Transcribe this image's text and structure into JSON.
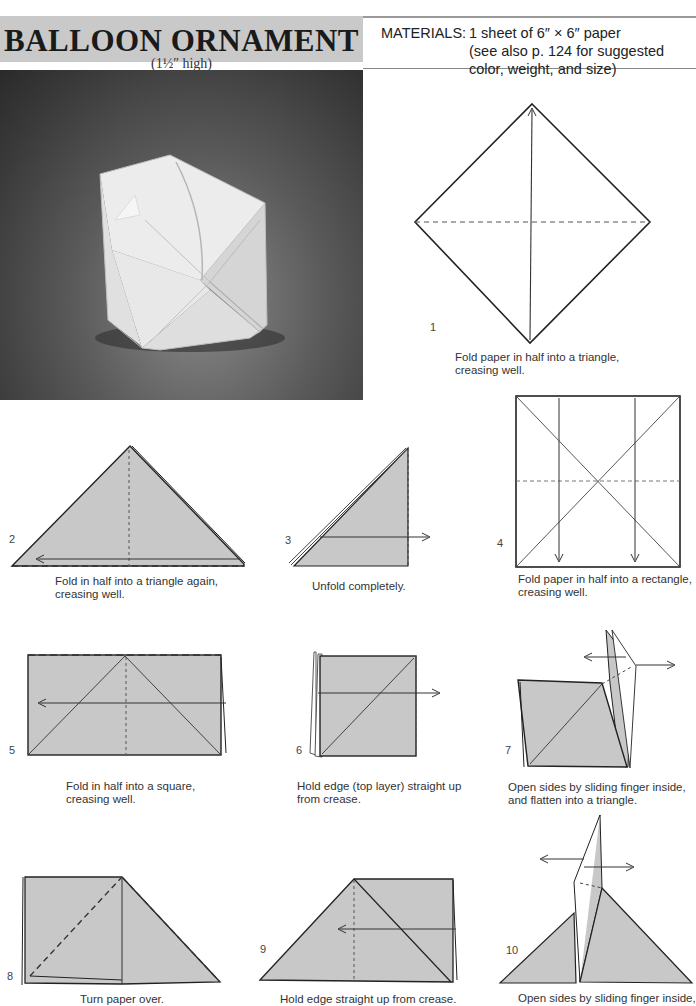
{
  "header": {
    "title": "BALLOON ORNAMENT",
    "subtitle": "(1½″ high)",
    "materials_label": "MATERIALS:",
    "materials_line1": "1 sheet of 6″ × 6″ paper",
    "materials_line2": "(see also p. 124 for suggested color, weight, and size)"
  },
  "photo": {
    "subject": "white folded paper balloon cube on dark gray background"
  },
  "colors": {
    "paper_fill": "#c8c8c8",
    "title_bg": "#c9c9c9",
    "line": "#222222"
  },
  "steps": [
    {
      "number": "1",
      "caption_line1": "Fold paper in half into a triangle,",
      "caption_line2": "creasing well."
    },
    {
      "number": "2",
      "caption_line1": "Fold in half into a triangle again,",
      "caption_line2": "creasing well."
    },
    {
      "number": "3",
      "caption_line1": "Unfold completely.",
      "caption_line2": ""
    },
    {
      "number": "4",
      "caption_line1": "Fold paper in half into a rectangle,",
      "caption_line2": "creasing well."
    },
    {
      "number": "5",
      "caption_line1": "Fold in half into a square,",
      "caption_line2": "creasing well."
    },
    {
      "number": "6",
      "caption_line1": "Hold edge (top layer) straight up",
      "caption_line2": "from crease."
    },
    {
      "number": "7",
      "caption_line1": "Open sides by sliding finger inside,",
      "caption_line2": "and flatten into a triangle."
    },
    {
      "number": "8",
      "caption_line1": "Turn paper over.",
      "caption_line2": ""
    },
    {
      "number": "9",
      "caption_line1": "Hold edge straight up from crease.",
      "caption_line2": ""
    },
    {
      "number": "10",
      "caption_line1": "Open sides by sliding finger inside,",
      "caption_line2": ""
    }
  ]
}
